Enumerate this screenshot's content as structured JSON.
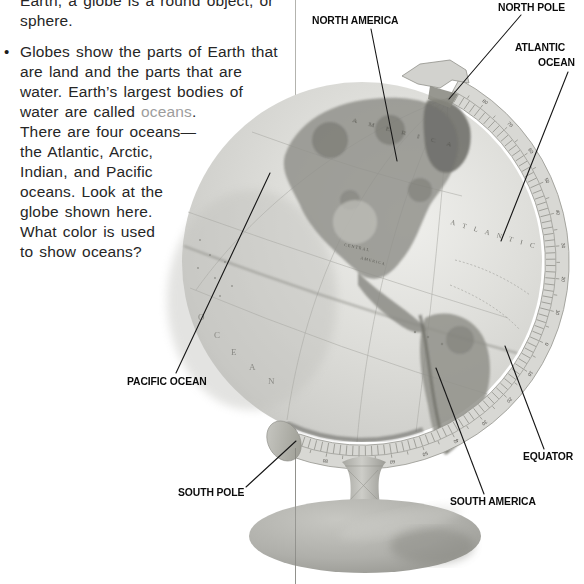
{
  "article": {
    "paragraph1": {
      "lines": [
        "Earth, a globe is a round object, or",
        "sphere."
      ]
    },
    "paragraph2": {
      "bullet": "•",
      "lines_before": [
        "Globes show the parts of Earth that",
        "are land and the parts that are",
        "water. Earth’s largest bodies of"
      ],
      "oceans_line": {
        "pre": "water are called ",
        "word": "oceans",
        "post": "."
      },
      "lines_after": [
        "There are four oceans—",
        "the Atlantic, Arctic,",
        "Indian, and Pacific",
        "oceans. Look at the",
        "globe shown here.",
        "What color is used",
        "to show oceans?"
      ],
      "keyword_color": "#9d9d9d"
    }
  },
  "figure": {
    "labels": {
      "north_america": "NORTH AMERICA",
      "north_pole": "NORTH POLE",
      "atlantic_line1": "ATLANTIC",
      "atlantic_line2": "OCEAN",
      "pacific_ocean": "PACIFIC OCEAN",
      "south_pole": "SOUTH POLE",
      "south_america": "SOUTH AMERICA",
      "equator": "EQUATOR"
    },
    "map_text": {
      "america_arc": "A M E R I C A",
      "atlantic_arc": "A T L A N T I C",
      "central": "CENTRAL",
      "america_small": "AMERICA",
      "ocean_letters": [
        "O",
        "C",
        "E",
        "A",
        "N"
      ]
    },
    "globe": {
      "ring": {
        "cx": 362,
        "cy": 262,
        "innerR": 183,
        "midR": 194,
        "outerR": 207,
        "numR": 200.5,
        "angleStart": -62,
        "angleSpan": 172,
        "rungEvery": 2,
        "numbers": [
          80,
          70,
          60,
          50,
          40,
          30,
          20,
          10,
          0,
          10,
          20,
          30,
          40,
          50,
          60,
          70,
          80
        ]
      }
    },
    "colors": {
      "ocean": "#d6d6d2",
      "land": "#8f8f89",
      "label_ink": "#0c0c0c"
    }
  }
}
